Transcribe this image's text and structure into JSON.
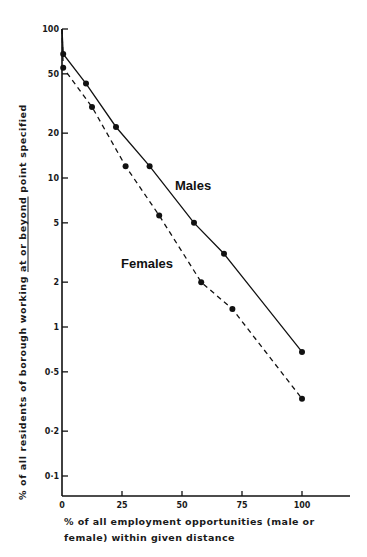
{
  "chart_data": {
    "type": "line",
    "title": "",
    "xlabel": "% of all employment opportunities (male or female) within given distance",
    "ylabel": "% of all residents of borough working at or beyond point specified",
    "ylabel_underlined": "at or beyond",
    "yscale": "log",
    "xlim": [
      0,
      118
    ],
    "ylim": [
      0.07,
      100
    ],
    "x_ticks": [
      0,
      25,
      50,
      75,
      100
    ],
    "x_tick_labels": [
      "0",
      "25",
      "50",
      "75",
      "100"
    ],
    "y_ticks": [
      100,
      50,
      20,
      10,
      5,
      2,
      1,
      0.5,
      0.2,
      0.1
    ],
    "y_tick_labels": [
      "100",
      "50",
      "20",
      "10",
      "5",
      "2",
      "1",
      "0·5",
      "0·2",
      "0·1"
    ],
    "grid": false,
    "legend": "inline labels",
    "series": [
      {
        "name": "Males",
        "style": "solid",
        "marker": "filled-circle",
        "x": [
          0,
          0.5,
          10,
          22.5,
          36.5,
          55,
          67.5,
          100
        ],
        "y": [
          100,
          68,
          43,
          22,
          12,
          5.0,
          3.1,
          0.68
        ],
        "label_pos": [
          175,
          190
        ]
      },
      {
        "name": "Females",
        "style": "dashed",
        "marker": "filled-circle",
        "x": [
          0,
          0.5,
          12.5,
          26.5,
          40.5,
          58,
          71,
          100
        ],
        "y": [
          100,
          55,
          30,
          12,
          5.6,
          2.0,
          1.32,
          0.33
        ],
        "label_pos": [
          121,
          268
        ]
      }
    ]
  },
  "text": {
    "x_title_line1": "% of all employment opportunities (male or",
    "x_title_line2": "female) within given distance"
  }
}
